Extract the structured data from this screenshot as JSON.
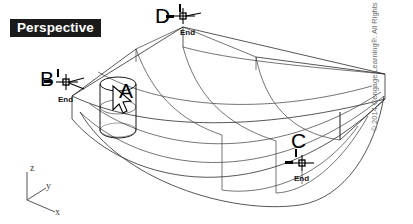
{
  "viewport": {
    "mode_label": "Perspective",
    "background_color": "#ffffff",
    "line_color": "#2b2b2b"
  },
  "points": [
    {
      "id": "A",
      "letter": "A",
      "snap_label": "",
      "has_snap_marker": false,
      "note": "cylinder object under cursor"
    },
    {
      "id": "B",
      "letter": "B",
      "snap_label": "End",
      "has_snap_marker": true
    },
    {
      "id": "C",
      "letter": "C",
      "snap_label": "End",
      "has_snap_marker": true
    },
    {
      "id": "D",
      "letter": "D",
      "snap_label": "End",
      "has_snap_marker": true
    }
  ],
  "osnap": {
    "type": "endpoint",
    "tooltip": "End"
  },
  "ucs_icon": {
    "name": "ucs-axis-icon",
    "axes": [
      "z",
      "y",
      "x"
    ]
  },
  "cursor": {
    "name": "mouse-pointer",
    "visible": true
  },
  "objects": {
    "surface": "curved edge surface mesh",
    "solid": "cylinder"
  },
  "copyright": "© 2014 Cengage Learning®. All Rights Reserved",
  "bottom_caption": ""
}
